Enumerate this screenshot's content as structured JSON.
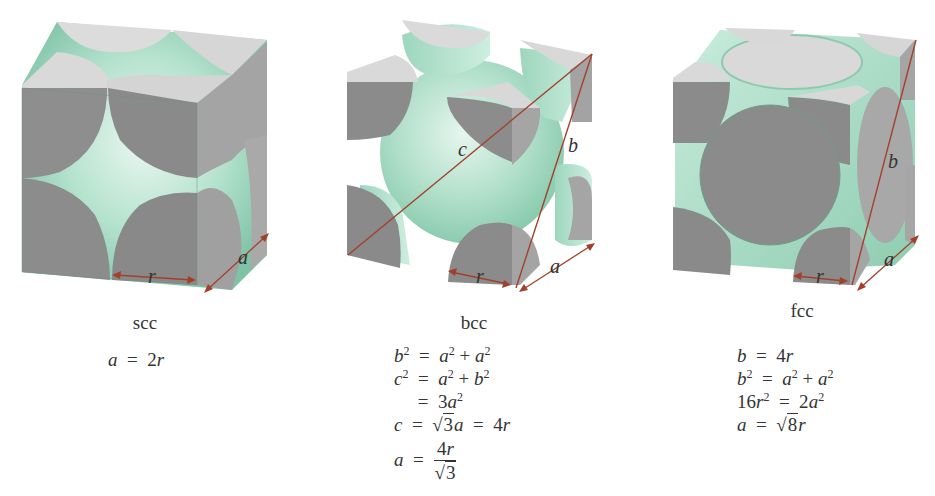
{
  "figure": {
    "colors": {
      "atom_cut_face": "#8c8c8c",
      "atom_top_face": "#d9d9d9",
      "atom_side_face": "#a6a6a6",
      "sphere_fill": "#a8dcc4",
      "sphere_highlight": "#e4f5ee",
      "dimension_line": "#a3402b",
      "text": "#333333"
    },
    "panels": [
      {
        "id": "scc",
        "caption": "scc",
        "labels": {
          "r": "r",
          "a": "a"
        },
        "equations": [
          {
            "lhs": "a",
            "op": "=",
            "rhs": "2r"
          }
        ]
      },
      {
        "id": "bcc",
        "caption": "bcc",
        "labels": {
          "r": "r",
          "a": "a",
          "b": "b",
          "c": "c"
        },
        "equations": [
          {
            "lhs": "b²",
            "op": "=",
            "rhs": "a² + a²"
          },
          {
            "lhs": "c²",
            "op": "=",
            "rhs": "a² + b²"
          },
          {
            "lhs": "",
            "op": "=",
            "rhs": "3a²"
          },
          {
            "lhs": "c",
            "op": "=",
            "rhs": "√3 a = 4r"
          },
          {
            "lhs": "a",
            "op": "=",
            "rhs_num": "4r",
            "rhs_den": "√3"
          }
        ]
      },
      {
        "id": "fcc",
        "caption": "fcc",
        "labels": {
          "r": "r",
          "a": "a",
          "b": "b"
        },
        "equations": [
          {
            "lhs": "b",
            "op": "=",
            "rhs": "4r"
          },
          {
            "lhs": "b²",
            "op": "=",
            "rhs": "a² + a²"
          },
          {
            "lhs": "16r²",
            "op": "=",
            "rhs": "2a²"
          },
          {
            "lhs": "a",
            "op": "=",
            "rhs": "√8 r"
          }
        ]
      }
    ]
  }
}
